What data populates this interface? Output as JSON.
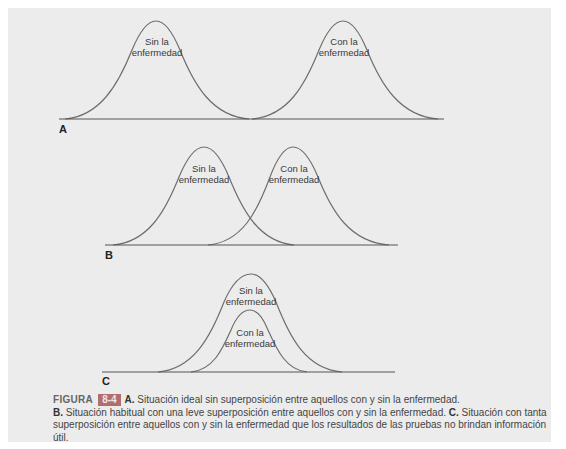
{
  "figure": {
    "panels": [
      {
        "id": "A",
        "letter": "A",
        "curves": [
          {
            "label_line1": "Sin la",
            "label_line2": "enfermedad",
            "x_start": 65,
            "x_peak": 156,
            "x_end": 249,
            "peak_y": 21
          },
          {
            "label_line1": "Con la",
            "label_line2": "enfermedad",
            "x_start": 252,
            "x_peak": 343,
            "x_end": 438,
            "peak_y": 21
          }
        ],
        "baseline": {
          "x1": 59,
          "x2": 444,
          "y": 119
        }
      },
      {
        "id": "B",
        "letter": "B",
        "curves": [
          {
            "label_line1": "Sin la",
            "label_line2": "enfermedad",
            "x_start": 113,
            "x_peak": 204,
            "x_end": 294,
            "peak_y": 147
          },
          {
            "label_line1": "Con la",
            "label_line2": "enfermedad",
            "x_start": 208,
            "x_peak": 293,
            "x_end": 389,
            "peak_y": 147
          }
        ],
        "baseline": {
          "x1": 105,
          "x2": 398,
          "y": 245
        }
      },
      {
        "id": "C",
        "letter": "C",
        "curves": [
          {
            "label_line1": "Sin la",
            "label_line2": "enfermedad",
            "x_start": 158,
            "x_peak": 251,
            "x_end": 342,
            "peak_y": 274
          },
          {
            "label_line1": "Con la",
            "label_line2": "enfermedad",
            "x_start": 191,
            "x_peak": 250,
            "x_end": 307,
            "peak_y": 310
          }
        ],
        "baseline": {
          "x1": 102,
          "x2": 395,
          "y": 372
        }
      }
    ],
    "caption": {
      "figure_word": "FIGURA",
      "figure_number": "8-4",
      "a_label": "A.",
      "a_text": " Situación ideal sin superposición entre aquellos con y sin la enfermedad.",
      "b_label": "B.",
      "b_text": " Situación habitual con una leve superposición entre aquellos con y sin la enfermedad. ",
      "c_label": "C.",
      "c_text": " Situación con tanta superposición entre aquellos con y sin la enfermedad que los resultados de las pruebas no brindan información útil."
    },
    "colors": {
      "panel_bg": "#ececec",
      "curve": "#6e6e6e",
      "badge": "#b06e6e"
    }
  }
}
